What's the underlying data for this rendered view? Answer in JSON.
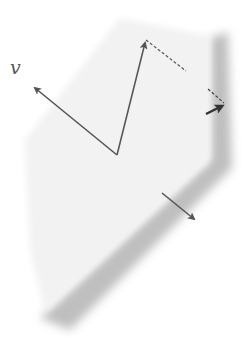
{
  "diagram": {
    "title": "",
    "labels": {
      "v": "v"
    },
    "colors": {
      "background": "#ffffff",
      "plane": "#f1f1f1",
      "shadow": "#a9a9a9",
      "arrow": "#555555",
      "dashed": "#555555"
    },
    "nodes": [
      {
        "id": "origin",
        "x": 117,
        "y": 155
      },
      {
        "id": "v-tip",
        "x": 33,
        "y": 87
      },
      {
        "id": "u-tip",
        "x": 146,
        "y": 40
      },
      {
        "id": "edge-proj",
        "x": 224,
        "y": 104
      }
    ],
    "edges": [
      {
        "from": "origin",
        "to": "v-tip",
        "style": "arrow",
        "label": "v"
      },
      {
        "from": "origin",
        "to": "u-tip",
        "style": "arrow"
      },
      {
        "from": "u-tip",
        "to": "edge-proj",
        "style": "dashed"
      },
      {
        "from": "plane-edge",
        "to": "edge-proj",
        "style": "arrow-short"
      },
      {
        "from": "bottom-edge",
        "to": "normal-tip",
        "style": "arrow"
      }
    ]
  }
}
